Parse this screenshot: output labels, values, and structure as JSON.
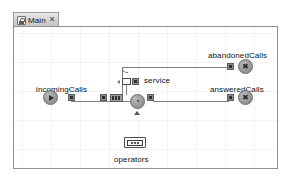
{
  "window": {
    "tab": {
      "label": "Main",
      "icon": "diagram-icon",
      "close_label": "✕"
    }
  },
  "canvas": {
    "grid": "on",
    "background_color": "#ffffff",
    "grid_color": "#f3f3f3",
    "border_color": "#8f8f8f"
  },
  "diagram": {
    "type": "process-flowchart",
    "blocks": [
      {
        "id": "incomingCalls",
        "label": "incomingCalls",
        "kind": "source",
        "glyph": "play-triangle"
      },
      {
        "id": "queue",
        "label": "",
        "kind": "queue",
        "glyph": "stacked-cells"
      },
      {
        "id": "service",
        "label": "service",
        "kind": "delay",
        "glyph": "clock"
      },
      {
        "id": "seize",
        "label": "",
        "kind": "seize-node",
        "glyph": "white-rect"
      },
      {
        "id": "abandonedCalls",
        "label": "abandonedCalls",
        "kind": "sink",
        "glyph": "cross"
      },
      {
        "id": "answeredCalls",
        "label": "answeredCalls",
        "kind": "sink",
        "glyph": "cross"
      },
      {
        "id": "operators",
        "label": "operators",
        "kind": "resource-pool",
        "glyph": "dots"
      }
    ],
    "connections": [
      {
        "from": "incomingCalls",
        "to": "queue"
      },
      {
        "from": "queue",
        "to": "service"
      },
      {
        "from": "service",
        "to": "answeredCalls"
      },
      {
        "from": "queue",
        "to": "abandonedCalls"
      }
    ],
    "glyphs": {
      "clock": "◔",
      "cross": "✖"
    }
  }
}
